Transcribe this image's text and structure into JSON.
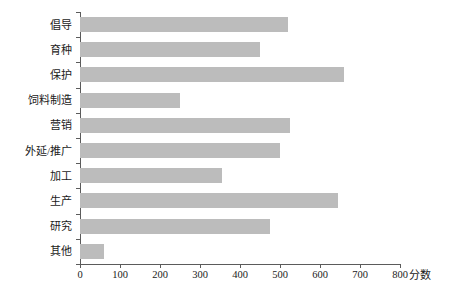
{
  "chart_data": {
    "type": "bar",
    "orientation": "horizontal",
    "title": "",
    "xlabel": "分数",
    "ylabel": "",
    "xlim": [
      0,
      800
    ],
    "xticks": [
      0,
      100,
      200,
      300,
      400,
      500,
      600,
      700,
      800
    ],
    "grid": false,
    "legend": null,
    "bar_color": "#bcbcbc",
    "axis_color": "#5b5b5b",
    "categories": [
      "倡导",
      "育种",
      "保护",
      "饲料制造",
      "营销",
      "外延/推广",
      "加工",
      "生产",
      "研究",
      "其他"
    ],
    "values": [
      520,
      450,
      660,
      250,
      525,
      500,
      355,
      645,
      475,
      60
    ]
  }
}
